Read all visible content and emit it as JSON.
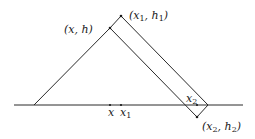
{
  "diagram": {
    "labels": {
      "xh": "(x, h)",
      "x1h1_open": "(x",
      "x1h1_sub1": "1",
      "x1h1_mid": ", h",
      "x1h1_sub2": "1",
      "x1h1_close": ")",
      "x2h2_open": "(x",
      "x2h2_sub1": "2",
      "x2h2_mid": ", h",
      "x2h2_sub2": "2",
      "x2h2_close": ")",
      "x2_base": "x",
      "x2_base_sub": "2",
      "tick_x": "x",
      "tick_x1": "x",
      "tick_x1_sub": "1"
    },
    "points": {
      "baseline": {
        "x1": 14,
        "x2": 243,
        "y": 105
      },
      "triangle_left_base": {
        "x": 34,
        "y": 105
      },
      "xh": {
        "x": 110,
        "y": 28
      },
      "x1h1": {
        "x": 121,
        "y": 16
      },
      "right_tip": {
        "x": 208,
        "y": 105
      },
      "x2h2": {
        "x": 197,
        "y": 117
      }
    }
  }
}
